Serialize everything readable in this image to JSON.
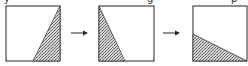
{
  "diagram": {
    "colors": {
      "outline": "#222222",
      "hatch_dark": "#555555",
      "hatch_light": "#d8d8d8",
      "background": "#ffffff"
    },
    "top_text_fragments": [
      "y",
      "g",
      "p"
    ],
    "panels": [
      {
        "id": "panel-1",
        "description": "Shaded triangle at bottom-right, hypotenuse from top-right corner to bottom edge",
        "points": "50,0 50,55 25,55"
      },
      {
        "id": "panel-2",
        "description": "Shaded triangle at left, from top-left corner down to bottom edge",
        "points": "0,0 0,55 25,55"
      },
      {
        "id": "panel-3",
        "description": "Shaded triangle at bottom, from left edge midpoint to bottom-right corner",
        "points": "0,25 0,55 55,55"
      }
    ],
    "arrows": [
      {
        "id": "arrow-1",
        "label": "→"
      },
      {
        "id": "arrow-2",
        "label": "→"
      }
    ]
  }
}
